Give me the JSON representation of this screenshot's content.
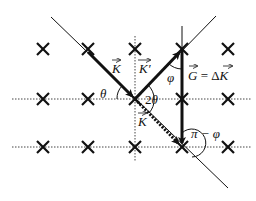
{
  "figure": {
    "type": "diagram",
    "colors": {
      "ink": "#111111",
      "background": "#ffffff",
      "dotted_line": "#444444"
    }
  },
  "lattice": {
    "columns_x": [
      43,
      88,
      135,
      182,
      228
    ],
    "rows_y": [
      49,
      99,
      147
    ],
    "marker": "cross",
    "dotted_rows_y": [
      99,
      147
    ]
  },
  "labels": {
    "K_incident": "K",
    "K_prime": "K′",
    "K_lower": "K",
    "theta": "θ",
    "two_theta": "2θ",
    "phi": "φ",
    "G_eq": "G = ΔK",
    "G": "G",
    "eq": " = Δ",
    "G_rhs": "K",
    "pi_minus_phi": "π − φ"
  }
}
